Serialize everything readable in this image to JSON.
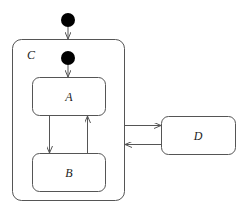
{
  "diagram": {
    "type": "state-machine",
    "states": [
      {
        "id": "C",
        "label": "C",
        "composite": true
      },
      {
        "id": "A",
        "label": "A",
        "parent": "C"
      },
      {
        "id": "B",
        "label": "B",
        "parent": "C"
      },
      {
        "id": "D",
        "label": "D"
      }
    ],
    "initial_states": [
      {
        "target": "C"
      },
      {
        "target": "A",
        "parent": "C"
      }
    ],
    "transitions": [
      {
        "from": "A",
        "to": "B"
      },
      {
        "from": "B",
        "to": "A"
      },
      {
        "from": "C",
        "to": "D"
      },
      {
        "from": "D",
        "to": "C"
      }
    ]
  }
}
